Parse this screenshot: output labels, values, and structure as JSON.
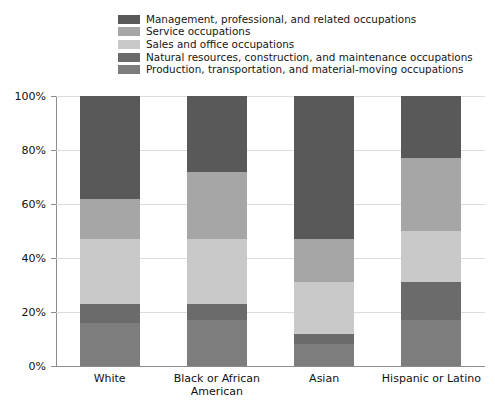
{
  "chart_data": {
    "type": "bar",
    "subtype": "stacked-percent",
    "title": "",
    "xlabel": "",
    "ylabel": "",
    "ylim": [
      0,
      100
    ],
    "yticks": [
      "0%",
      "20%",
      "40%",
      "60%",
      "80%",
      "100%"
    ],
    "ytick_values": [
      0,
      20,
      40,
      60,
      80,
      100
    ],
    "grid": true,
    "legend_position": "top",
    "categories": [
      "White",
      "Black or African American",
      "Asian",
      "Hispanic or Latino"
    ],
    "series": [
      {
        "name": "Management, professional, and related occupations",
        "color": "#595959",
        "values": [
          38,
          28,
          53,
          23
        ]
      },
      {
        "name": "Service occupations",
        "color": "#a6a6a6",
        "values": [
          15,
          25,
          16,
          27
        ]
      },
      {
        "name": "Sales and office occupations",
        "color": "#c9c9c9",
        "values": [
          24,
          24,
          19,
          19
        ]
      },
      {
        "name": "Natural resources, construction, and maintenance occupations",
        "color": "#6b6b6b",
        "values": [
          7,
          6,
          4,
          14
        ]
      },
      {
        "name": "Production, transportation, and material-moving occupations",
        "color": "#7d7d7d",
        "values": [
          16,
          17,
          8,
          17
        ]
      }
    ]
  },
  "legend": {
    "items": [
      {
        "label": "Management, professional, and related occupations",
        "color": "#595959"
      },
      {
        "label": "Service occupations",
        "color": "#a6a6a6"
      },
      {
        "label": "Sales and office occupations",
        "color": "#c9c9c9"
      },
      {
        "label": "Natural resources, construction, and maintenance occupations",
        "color": "#6b6b6b"
      },
      {
        "label": "Production, transportation, and material-moving occupations",
        "color": "#7d7d7d"
      }
    ]
  },
  "axes": {
    "y_tick_labels": [
      "100%",
      "80%",
      "60%",
      "40%",
      "20%",
      "0%"
    ],
    "x_tick_labels": [
      [
        "White"
      ],
      [
        "Black or African",
        "American"
      ],
      [
        "Asian"
      ],
      [
        "Hispanic or Latino"
      ]
    ]
  },
  "style": {
    "background": "#ffffff",
    "grid_color": "#d6d6d6",
    "axis_color": "#8c8c8c",
    "text_color": "#111111"
  }
}
